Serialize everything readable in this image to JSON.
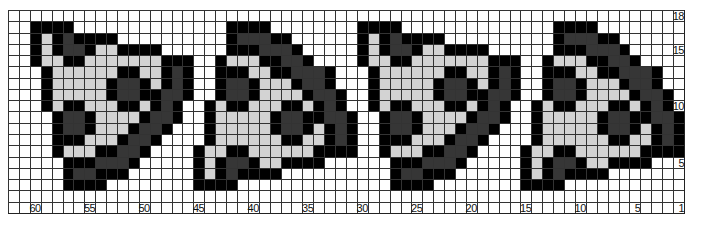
{
  "pattern": {
    "title": "Pixel pattern chart",
    "columns": 62,
    "rows": 18,
    "legend": {
      "0": {
        "name": "white",
        "color": "#ffffff"
      },
      "1": {
        "name": "light-gray",
        "color": "#d3d3d3"
      },
      "2": {
        "name": "dark-gray",
        "color": "#363636"
      },
      "3": {
        "name": "black",
        "color": "#000000"
      }
    },
    "repeat_width": 30,
    "base_rows": [
      "00000000000000000000000000000000",
      "00333300000000000000333300000000",
      "00313233330000000000322233000000",
      "00313223113333000000333222300000",
      "00311331111111333003111332230000",
      "00031111113311323003331133222300",
      "00031111132231323003223111322300",
      "00031111132233223003223111132230",
      "00031331113313230031331113313230",
      "00003223111132230031111132233223",
      "00003223111322300031111132231323",
      "00003331113223000031111113311323",
      "00003111332230000311331111113333",
      "00000333222300000313223113333000",
      "00000322333000000313233330000000",
      "00000333300000000333300000000000",
      "00000000000000000000000000000000",
      "00000000000000000000000000000000"
    ]
  },
  "axis": {
    "column_labels": [
      {
        "col": 2,
        "text": "60"
      },
      {
        "col": 7,
        "text": "55"
      },
      {
        "col": 12,
        "text": "50"
      },
      {
        "col": 17,
        "text": "45"
      },
      {
        "col": 22,
        "text": "40"
      },
      {
        "col": 27,
        "text": "35"
      },
      {
        "col": 32,
        "text": "30"
      },
      {
        "col": 37,
        "text": "25"
      },
      {
        "col": 42,
        "text": "20"
      },
      {
        "col": 47,
        "text": "15"
      },
      {
        "col": 52,
        "text": "10"
      },
      {
        "col": 57,
        "text": "5"
      },
      {
        "col": 61,
        "text": "1"
      }
    ],
    "row_labels": [
      {
        "row": 0,
        "text": "18"
      },
      {
        "row": 3,
        "text": "15"
      },
      {
        "row": 8,
        "text": "10"
      },
      {
        "row": 13,
        "text": "5"
      }
    ]
  }
}
